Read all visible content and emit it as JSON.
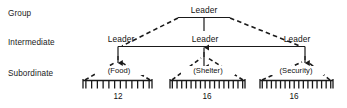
{
  "diagram": {
    "tier_labels": [
      {
        "id": "group",
        "label": "Group"
      },
      {
        "id": "intermediate",
        "label": "Intermediate"
      },
      {
        "id": "subordinate",
        "label": "Subordinate"
      }
    ],
    "nodes": {
      "group_leader": "Leader",
      "intermediate_leader_left": "Leader",
      "intermediate_leader_middle": "Leader",
      "intermediate_leader_right": "Leader"
    },
    "units": [
      {
        "id": "food",
        "name": "(Food)",
        "count": "12",
        "teeth": 12
      },
      {
        "id": "shelter",
        "name": "(Shelter)",
        "count": "16",
        "teeth": 16
      },
      {
        "id": "security",
        "name": "(Security)",
        "count": "16",
        "teeth": 16
      }
    ],
    "colors": {
      "stroke": "#1a1a1a",
      "text": "#111111",
      "background": "#ffffff"
    }
  }
}
